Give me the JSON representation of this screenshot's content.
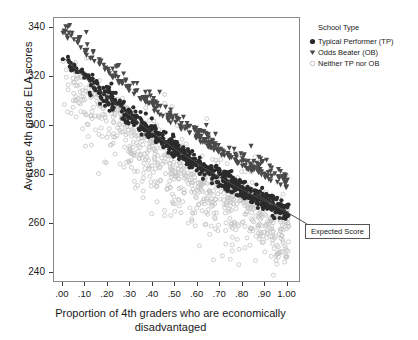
{
  "chart_data": {
    "type": "scatter",
    "title": "",
    "xlabel": "Proportion of 4th graders who are economically disadvantaged",
    "ylabel": "Average 4th grade ELA scores",
    "xlim": [
      -0.04,
      1.06
    ],
    "ylim": [
      236,
      344
    ],
    "xticks": [
      0.0,
      0.1,
      0.2,
      0.3,
      0.4,
      0.5,
      0.6,
      0.7,
      0.8,
      0.9,
      1.0
    ],
    "xticklabels": [
      ".00",
      ".10",
      ".20",
      ".30",
      ".40",
      ".50",
      ".60",
      ".70",
      ".80",
      ".90",
      "1.00"
    ],
    "yticks": [
      240,
      260,
      280,
      300,
      320,
      340
    ],
    "yticklabels": [
      "240",
      "260",
      "280",
      "300",
      "320",
      "340"
    ],
    "grid": false,
    "legend_position": "right",
    "legend_title": "School Type",
    "series": [
      {
        "name": "Typical Performer (TP)",
        "marker": "circle-filled",
        "color": "#2b2b2b",
        "count": 620,
        "band_offset_center": 0.0,
        "band_sd": 2.0
      },
      {
        "name": "Odds Beater (OB)",
        "marker": "triangle-down",
        "color": "#4a4a4a",
        "count": 300,
        "band_offset_center": 9.5,
        "band_sd": 4.0
      },
      {
        "name": "Neither TP nor OB",
        "marker": "circle-open",
        "color": "#c2c2c2",
        "count": 820,
        "band_offset_center": -7.0,
        "band_sd": 9.5
      }
    ],
    "trend_line": {
      "label": "Expected Score",
      "x_start": 0.0,
      "y_start": 328.0,
      "x_end": 1.0,
      "y_end": 265.0,
      "curvature": -6.0,
      "color": "#4a4a4a"
    },
    "annotations": [
      {
        "text": "Expected Score",
        "x": 0.86,
        "y": 271.0,
        "box": true
      }
    ]
  },
  "axes": {
    "y_title": "Average 4th grade ELA scores",
    "x_title_line1": "Proportion of 4th graders who are economically",
    "x_title_line2": "disadvantaged"
  },
  "legend": {
    "title": "School Type",
    "items": [
      {
        "label": "Typical Performer (TP)",
        "marker": "circle-filled"
      },
      {
        "label": "Odds Beater (OB)",
        "marker": "triangle-down"
      },
      {
        "label": "Neither TP nor OB",
        "marker": "circle-open"
      }
    ]
  },
  "callout": {
    "label": "Expected Score"
  }
}
